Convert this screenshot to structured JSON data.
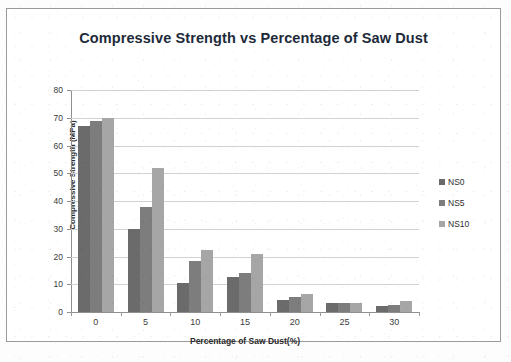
{
  "chart_data": {
    "type": "bar",
    "title": "Compressive Strength vs Percentage of Saw Dust",
    "xlabel": "Percentage of Saw Dust(%)",
    "ylabel": "Compressive Strength (MPa)",
    "categories": [
      "0",
      "5",
      "10",
      "15",
      "20",
      "25",
      "30"
    ],
    "series": [
      {
        "name": "NS0",
        "color": "#6b6b6b",
        "values": [
          67,
          30,
          10.5,
          12.5,
          4.5,
          3.3,
          2
        ]
      },
      {
        "name": "NS5",
        "color": "#7d7d7d",
        "values": [
          69,
          38,
          18.5,
          14,
          5.5,
          3.3,
          2.5
        ]
      },
      {
        "name": "NS10",
        "color": "#a6a6a6",
        "values": [
          70,
          52,
          22.5,
          21,
          6.5,
          3.3,
          4
        ]
      }
    ],
    "ylim": [
      0,
      80
    ],
    "yticks": [
      "0",
      "10",
      "20",
      "30",
      "40",
      "50",
      "60",
      "70",
      "80"
    ],
    "grid": true,
    "legend_position": "right"
  },
  "page": {
    "bottom_artifact": ""
  }
}
